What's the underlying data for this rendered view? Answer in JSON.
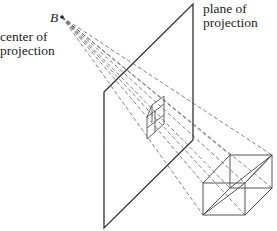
{
  "figure": {
    "point_label": "B",
    "center_label_line1": "center of",
    "center_label_line2": "projection",
    "plane_label_line1": "plane of",
    "plane_label_line2": "projection"
  },
  "colors": {
    "solid_line": "#333333",
    "cube_line": "#555555",
    "dashed_line": "#666666",
    "text": "#222222"
  }
}
